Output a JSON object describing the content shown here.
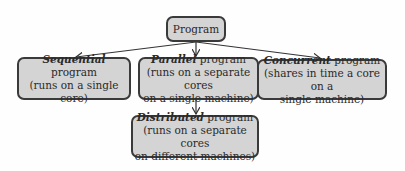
{
  "diagram": {
    "root": {
      "label": "Program"
    },
    "nodes": [
      {
        "id": "sequential",
        "name_emph": "Sequential",
        "name_rest": " program",
        "desc": "(runs on a single core)"
      },
      {
        "id": "parallel",
        "name_emph": "Parallel",
        "name_rest": " program",
        "desc_lines": [
          "(runs on a separate cores",
          "on a single machine)"
        ]
      },
      {
        "id": "concurrent",
        "name_emph": "Concurrent",
        "name_rest": " program",
        "desc_lines": [
          "(shares in time a core on a",
          "single machine)"
        ]
      },
      {
        "id": "distributed",
        "name_emph": "Distributed",
        "name_rest": " program",
        "desc_lines": [
          "(runs on a separate cores",
          "on different machines)"
        ]
      }
    ],
    "edges": [
      {
        "from": "Program",
        "to": "Sequential"
      },
      {
        "from": "Program",
        "to": "Parallel"
      },
      {
        "from": "Program",
        "to": "Concurrent"
      },
      {
        "from": "Parallel",
        "to": "Distributed"
      }
    ]
  }
}
